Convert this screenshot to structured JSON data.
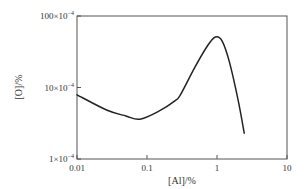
{
  "chart_data": {
    "type": "line",
    "title": "",
    "xlabel": "[Al]/%",
    "ylabel": "[O]/%",
    "xscale": "log",
    "yscale": "log",
    "xlim": [
      0.01,
      10
    ],
    "ylim": [
      0.0001,
      0.01
    ],
    "grid": false,
    "legend": "none",
    "x_ticks": [
      {
        "value": 0.01,
        "label": "0.01"
      },
      {
        "value": 0.1,
        "label": "0.1"
      },
      {
        "value": 1,
        "label": "1"
      },
      {
        "value": 10,
        "label": "10"
      }
    ],
    "y_ticks": [
      {
        "value": 0.0001,
        "label_mantissa": "1×10",
        "label_exp": "−4"
      },
      {
        "value": 0.001,
        "label_mantissa": "10×10",
        "label_exp": "−4"
      },
      {
        "value": 0.01,
        "label_mantissa": "100×10",
        "label_exp": "−4"
      }
    ],
    "series": [
      {
        "name": "[O] vs [Al]",
        "color": "#222222",
        "x": [
          0.01,
          0.027,
          0.05,
          0.079,
          0.15,
          0.25,
          0.3,
          0.48,
          0.74,
          0.95,
          1.18,
          1.5,
          2.0,
          2.45
        ],
        "y": [
          0.00079,
          0.00048,
          0.0004,
          0.00036,
          0.00047,
          0.00065,
          0.00079,
          0.0019,
          0.0039,
          0.0051,
          0.0045,
          0.0023,
          0.00067,
          0.00023
        ]
      }
    ]
  }
}
